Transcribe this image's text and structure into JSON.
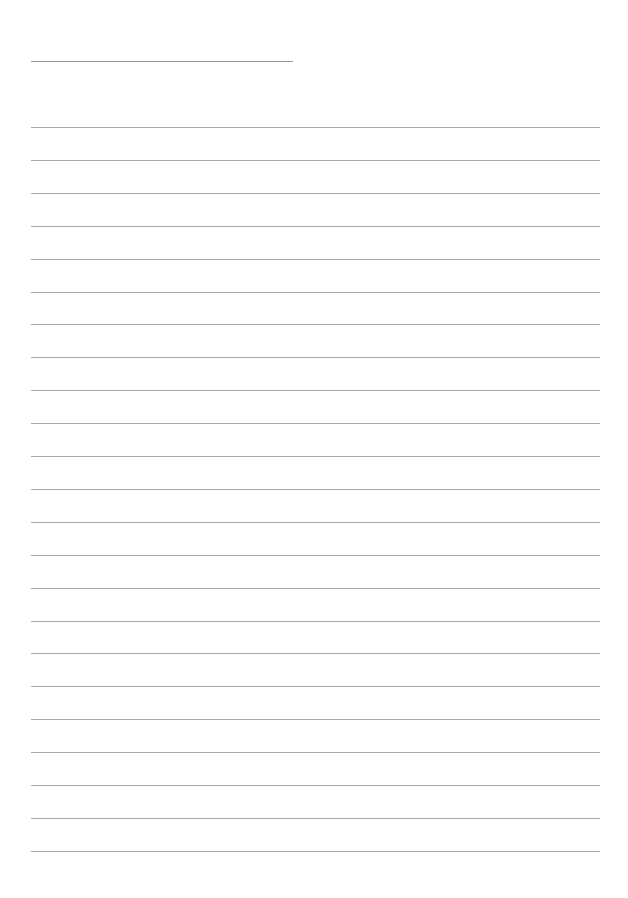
{
  "page": {
    "type": "lined-paper",
    "background": "#ffffff",
    "line_color": "#a8a8a8"
  },
  "header_line": {
    "x": 31,
    "y": 61,
    "width": 262
  },
  "rules": {
    "x": 31,
    "width": 569,
    "start_y": 127,
    "spacing": 32.9,
    "count": 23
  }
}
